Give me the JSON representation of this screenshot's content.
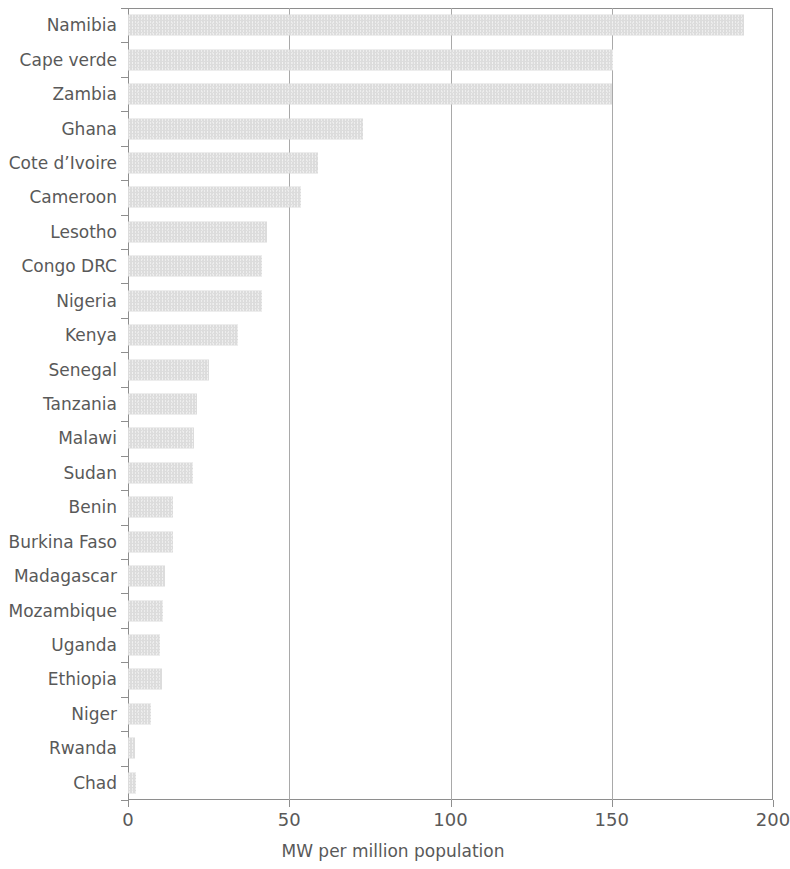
{
  "chart_data": {
    "type": "bar",
    "orientation": "horizontal",
    "title": "",
    "xlabel": "MW per million population",
    "ylabel": "",
    "xlim": [
      0,
      200
    ],
    "xticks": [
      0,
      50,
      100,
      150,
      200
    ],
    "xtick_labels": [
      "0",
      "50",
      "100",
      "150",
      "200"
    ],
    "grid": "vertical-only",
    "legend": "none",
    "bar_color": "#dcdcdc",
    "axis_color": "#8e8e8e",
    "text_color": "#595959",
    "categories": [
      "Namibia",
      "Cape verde",
      "Zambia",
      "Ghana",
      "Cote d’Ivoire",
      "Cameroon",
      "Lesotho",
      "Congo DRC",
      "Nigeria",
      "Kenya",
      "Senegal",
      "Tanzania",
      "Malawi",
      "Sudan",
      "Benin",
      "Burkina Faso",
      "Madagascar",
      "Mozambique",
      "Uganda",
      "Ethiopia",
      "Niger",
      "Rwanda",
      "Chad"
    ],
    "values": [
      191,
      150.5,
      150,
      73,
      59,
      53.5,
      43,
      41.5,
      41.5,
      34,
      25,
      21.5,
      20.5,
      20,
      14,
      14,
      11.5,
      11,
      10,
      10.5,
      7,
      2.2,
      2.5
    ]
  }
}
